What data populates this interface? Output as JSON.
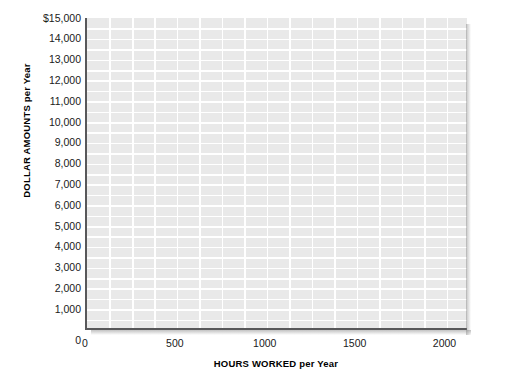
{
  "chart_data": {
    "type": "line",
    "title": "",
    "subtitle": "",
    "xlabel_caps": "HOURS WORKED",
    "xlabel_rest": "per Year",
    "xlabel": "HOURS WORKED per Year",
    "ylabel_caps": "DOLLAR AMOUNTS",
    "ylabel_rest": "per Year",
    "ylabel": "DOLLAR AMOUNTS per Year",
    "xlim": [
      0,
      2125
    ],
    "ylim": [
      0,
      15000
    ],
    "grid": true,
    "grid_color": "#ffffff",
    "plot_background": "#e9e9e9",
    "axis_color": "#58585a",
    "legend": null,
    "legend_position": "none",
    "series": [],
    "x_ticks": [
      {
        "value": 0,
        "label": "0"
      },
      {
        "value": 500,
        "label": "500"
      },
      {
        "value": 1000,
        "label": "1000"
      },
      {
        "value": 1500,
        "label": "1500"
      },
      {
        "value": 2000,
        "label": "2000"
      }
    ],
    "x_minor_step": 125,
    "y_minor_step": 500,
    "y_ticks": [
      {
        "value": 15000,
        "label": "$15,000"
      },
      {
        "value": 14000,
        "label": "14,000"
      },
      {
        "value": 13000,
        "label": "13,000"
      },
      {
        "value": 12000,
        "label": "12,000"
      },
      {
        "value": 11000,
        "label": "11,000"
      },
      {
        "value": 10000,
        "label": "10,000"
      },
      {
        "value": 9000,
        "label": "9,000"
      },
      {
        "value": 8000,
        "label": "8,000"
      },
      {
        "value": 7000,
        "label": "7,000"
      },
      {
        "value": 6000,
        "label": "6,000"
      },
      {
        "value": 5000,
        "label": "5,000"
      },
      {
        "value": 4000,
        "label": "4,000"
      },
      {
        "value": 3000,
        "label": "3,000"
      },
      {
        "value": 2000,
        "label": "2,000"
      },
      {
        "value": 1000,
        "label": "1,000"
      },
      {
        "value": 0,
        "label": "0"
      }
    ]
  }
}
